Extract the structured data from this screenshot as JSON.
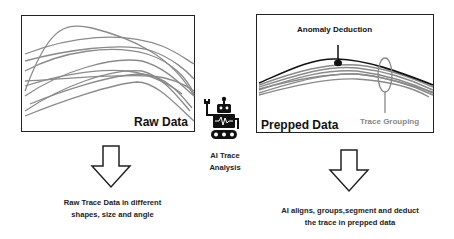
{
  "raw_panel": {
    "label": "Raw Data"
  },
  "prepped_panel": {
    "label": "Prepped Data",
    "annotations": {
      "anomaly": "Anomaly Deduction",
      "grouping": "Trace Grouping"
    }
  },
  "center": {
    "icon": "robot-icon",
    "line1": "AI Trace",
    "line2": "Analysis"
  },
  "left_caption": {
    "line1": "Raw Trace Data in different",
    "line2": "shapes, size and angle"
  },
  "right_caption": {
    "line1": "AI aligns, groups,segment and deduct",
    "line2": "the trace in prepped data"
  },
  "colors": {
    "trace_gray": "#8a8a8a",
    "anomaly_black": "#111111",
    "grouping_label": "#888888"
  }
}
